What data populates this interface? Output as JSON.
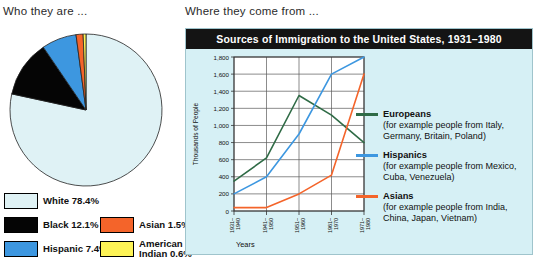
{
  "left": {
    "heading": "Who they are ...",
    "legend": [
      {
        "label": "White 78.4%",
        "color": "#dff2f5"
      },
      {
        "label": "Black 12.1%",
        "color": "#050505"
      },
      {
        "label": "Hispanic 7.4%",
        "color": "#3d97e0"
      },
      {
        "label": "Asian 1.5%",
        "color": "#f4642a"
      },
      {
        "label": "American Indian 0.6%",
        "color": "#fdf356"
      }
    ]
  },
  "right": {
    "heading": "Where they come from ...",
    "title": "Sources of Immigration to the United States, 1931–1980"
  },
  "chart_data": {
    "type": "pie",
    "title": "Who they are",
    "categories": [
      "White",
      "Black",
      "Hispanic",
      "Asian",
      "American Indian"
    ],
    "values": [
      78.4,
      12.1,
      7.4,
      1.5,
      0.6
    ],
    "unit": "%",
    "colors": [
      "#dff2f5",
      "#050505",
      "#3d97e0",
      "#f4642a",
      "#fdf356"
    ],
    "start_angle": 0,
    "direction": "clockwise",
    "legend_position": "below"
  },
  "chart_data_2": {
    "type": "line",
    "title": "Sources of Immigration to the United States, 1931–1980",
    "xlabel": "Years",
    "ylabel": "Thousands of People",
    "categories": [
      "1931–1940",
      "1941–1950",
      "1951–1960",
      "1961–1970",
      "1971–1980"
    ],
    "ylim": [
      0,
      1800
    ],
    "yticks": [
      0,
      200,
      400,
      600,
      800,
      1000,
      1200,
      1400,
      1600,
      1800
    ],
    "ytick_labels": [
      "0",
      "200",
      "400",
      "600",
      "800",
      "1,000",
      "1,200",
      "1,400",
      "1,600",
      "1,800"
    ],
    "grid": true,
    "legend_position": "right",
    "series": [
      {
        "name": "Europeans",
        "sub": "(for example people from Italy, Germany, Britain, Poland)",
        "color": "#2f6b46",
        "values": [
          350,
          620,
          1350,
          1120,
          800
        ]
      },
      {
        "name": "Hispanics",
        "sub": "(for example people from Mexico, Cuba, Venezuela)",
        "color": "#3d97e0",
        "values": [
          200,
          400,
          900,
          1600,
          1800
        ]
      },
      {
        "name": "Asians",
        "sub": "(for example people from India, China, Japan, Vietnam)",
        "color": "#f4642a",
        "values": [
          40,
          40,
          200,
          420,
          1600
        ]
      }
    ]
  }
}
